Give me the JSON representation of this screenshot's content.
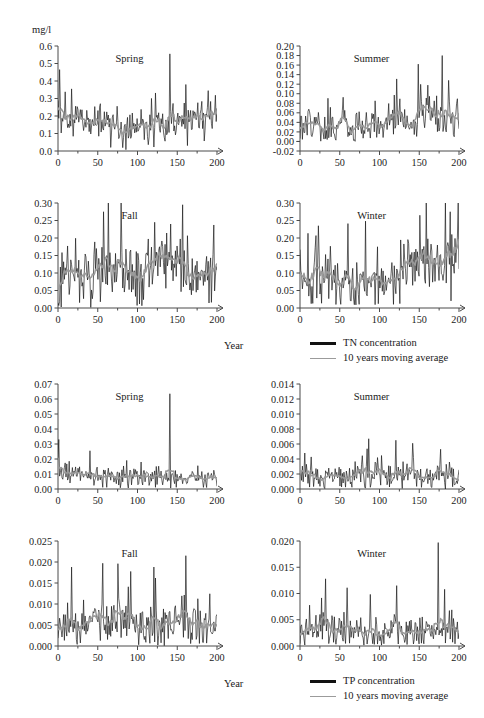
{
  "figure": {
    "unit_label": "mg/l",
    "x_axis_title": "Year"
  },
  "legends": [
    {
      "id": "tn-legend",
      "entries": [
        {
          "label": "TN concentration",
          "style": "thick",
          "color": "#111111"
        },
        {
          "label": "10 years moving average",
          "style": "thin",
          "color": "#9b9b9b"
        }
      ]
    },
    {
      "id": "tp-legend",
      "entries": [
        {
          "label": "TP concentration",
          "style": "thick",
          "color": "#111111"
        },
        {
          "label": "10 years moving average",
          "style": "thin",
          "color": "#9b9b9b"
        }
      ]
    }
  ],
  "chart_data": [
    {
      "id": "tn-spring",
      "type": "line",
      "title": "Spring",
      "variable": "TN concentration",
      "xlabel": "Year",
      "ylabel": "mg/l",
      "xlim": [
        0,
        200
      ],
      "ylim": [
        0.0,
        0.6
      ],
      "xticks": [
        0,
        50,
        100,
        150,
        200
      ],
      "yticks": [
        0.0,
        0.1,
        0.2,
        0.3,
        0.4,
        0.5,
        0.6
      ],
      "ytick_labels": [
        "0.0",
        "0.1",
        "0.2",
        "0.3",
        "0.4",
        "0.5",
        "0.6"
      ],
      "xtick_labels": [
        "0",
        "50",
        "100",
        "150",
        "200"
      ],
      "grid": false,
      "series": [
        {
          "name": "TN concentration",
          "color": "#111111",
          "noise_mean": 0.165,
          "noise_sd": 0.055,
          "clip_min": 0.0,
          "seed": 11,
          "n": 200,
          "trend": [
            {
              "x": 0,
              "y": 0.19
            },
            {
              "x": 20,
              "y": 0.185
            },
            {
              "x": 40,
              "y": 0.145
            },
            {
              "x": 70,
              "y": 0.145
            },
            {
              "x": 100,
              "y": 0.14
            },
            {
              "x": 125,
              "y": 0.145
            },
            {
              "x": 140,
              "y": 0.19
            },
            {
              "x": 165,
              "y": 0.19
            },
            {
              "x": 200,
              "y": 0.195
            }
          ],
          "spikes": [
            {
              "x": 140,
              "y": 0.555
            },
            {
              "x": 2,
              "y": 0.465
            },
            {
              "x": 17,
              "y": 0.355
            },
            {
              "x": 160,
              "y": 0.38
            },
            {
              "x": 188,
              "y": 0.345
            }
          ]
        },
        {
          "name": "10 years moving average",
          "color": "#9a9a9a",
          "window": 10,
          "derived_from": "TN concentration"
        }
      ]
    },
    {
      "id": "tn-summer",
      "type": "line",
      "title": "Summer",
      "variable": "TN concentration",
      "xlabel": "Year",
      "ylabel": "mg/l",
      "xlim": [
        0,
        200
      ],
      "ylim": [
        -0.02,
        0.2
      ],
      "xticks": [
        0,
        50,
        100,
        150,
        200
      ],
      "yticks": [
        -0.02,
        0.0,
        0.02,
        0.04,
        0.06,
        0.08,
        0.1,
        0.12,
        0.14,
        0.16,
        0.18,
        0.2
      ],
      "ytick_labels": [
        "-0.02",
        "0.00",
        "0.02",
        "0.04",
        "0.06",
        "0.08",
        "0.10",
        "0.12",
        "0.14",
        "0.16",
        "0.18",
        "0.20"
      ],
      "xtick_labels": [
        "0",
        "50",
        "100",
        "150",
        "200"
      ],
      "grid": false,
      "series": [
        {
          "name": "TN concentration",
          "color": "#111111",
          "noise_mean": 0.04,
          "noise_sd": 0.021,
          "clip_min": 0.0,
          "seed": 23,
          "n": 200,
          "trend": [
            {
              "x": 0,
              "y": 0.036
            },
            {
              "x": 30,
              "y": 0.032
            },
            {
              "x": 60,
              "y": 0.03
            },
            {
              "x": 90,
              "y": 0.036
            },
            {
              "x": 120,
              "y": 0.038
            },
            {
              "x": 150,
              "y": 0.04
            },
            {
              "x": 175,
              "y": 0.048
            },
            {
              "x": 200,
              "y": 0.044
            }
          ],
          "spikes": [
            {
              "x": 178,
              "y": 0.18
            },
            {
              "x": 148,
              "y": 0.162
            },
            {
              "x": 121,
              "y": 0.131
            },
            {
              "x": 186,
              "y": 0.128
            },
            {
              "x": 160,
              "y": 0.118
            }
          ]
        },
        {
          "name": "10 years moving average",
          "color": "#9a9a9a",
          "window": 10,
          "derived_from": "TN concentration"
        }
      ]
    },
    {
      "id": "tn-fall",
      "type": "line",
      "title": "Fall",
      "variable": "TN concentration",
      "xlabel": "Year",
      "ylabel": "mg/l",
      "xlim": [
        0,
        200
      ],
      "ylim": [
        0.0,
        0.3
      ],
      "xticks": [
        0,
        50,
        100,
        150,
        200
      ],
      "yticks": [
        0.0,
        0.05,
        0.1,
        0.15,
        0.2,
        0.25,
        0.3
      ],
      "ytick_labels": [
        "0.00",
        "0.05",
        "0.10",
        "0.15",
        "0.20",
        "0.25",
        "0.30"
      ],
      "xtick_labels": [
        "0",
        "50",
        "100",
        "150",
        "200"
      ],
      "grid": false,
      "series": [
        {
          "name": "TN concentration",
          "color": "#111111",
          "noise_mean": 0.105,
          "noise_sd": 0.04,
          "clip_min": 0.0,
          "seed": 37,
          "n": 200,
          "trend": [
            {
              "x": 0,
              "y": 0.1
            },
            {
              "x": 25,
              "y": 0.105
            },
            {
              "x": 55,
              "y": 0.115
            },
            {
              "x": 85,
              "y": 0.09
            },
            {
              "x": 110,
              "y": 0.095
            },
            {
              "x": 125,
              "y": 0.125
            },
            {
              "x": 155,
              "y": 0.13
            },
            {
              "x": 180,
              "y": 0.1
            },
            {
              "x": 200,
              "y": 0.115
            }
          ],
          "spikes": [
            {
              "x": 63,
              "y": 0.3
            },
            {
              "x": 156,
              "y": 0.295
            },
            {
              "x": 57,
              "y": 0.275
            },
            {
              "x": 121,
              "y": 0.245
            },
            {
              "x": 141,
              "y": 0.24
            }
          ]
        },
        {
          "name": "10 years moving average",
          "color": "#9a9a9a",
          "window": 10,
          "derived_from": "TN concentration"
        }
      ]
    },
    {
      "id": "tn-winter",
      "type": "line",
      "title": "Winter",
      "variable": "TN concentration",
      "xlabel": "Year",
      "ylabel": "mg/l",
      "xlim": [
        0,
        200
      ],
      "ylim": [
        0.0,
        0.3
      ],
      "xticks": [
        0,
        50,
        100,
        150,
        200
      ],
      "yticks": [
        0.0,
        0.05,
        0.1,
        0.15,
        0.2,
        0.25,
        0.3
      ],
      "ytick_labels": [
        "0.00",
        "0.05",
        "0.10",
        "0.15",
        "0.20",
        "0.25",
        "0.30"
      ],
      "xtick_labels": [
        "0",
        "50",
        "100",
        "150",
        "200"
      ],
      "grid": false,
      "series": [
        {
          "name": "TN concentration",
          "color": "#111111",
          "noise_mean": 0.095,
          "noise_sd": 0.042,
          "clip_min": 0.0,
          "seed": 53,
          "n": 200,
          "trend": [
            {
              "x": 0,
              "y": 0.095
            },
            {
              "x": 20,
              "y": 0.1
            },
            {
              "x": 45,
              "y": 0.075
            },
            {
              "x": 70,
              "y": 0.07
            },
            {
              "x": 95,
              "y": 0.08
            },
            {
              "x": 120,
              "y": 0.085
            },
            {
              "x": 145,
              "y": 0.12
            },
            {
              "x": 165,
              "y": 0.135
            },
            {
              "x": 185,
              "y": 0.13
            },
            {
              "x": 200,
              "y": 0.13
            }
          ],
          "spikes": [
            {
              "x": 158,
              "y": 0.305
            },
            {
              "x": 182,
              "y": 0.3
            },
            {
              "x": 150,
              "y": 0.265
            },
            {
              "x": 188,
              "y": 0.275
            },
            {
              "x": 23,
              "y": 0.235
            }
          ]
        },
        {
          "name": "10 years moving average",
          "color": "#9a9a9a",
          "window": 10,
          "derived_from": "TN concentration"
        }
      ]
    },
    {
      "id": "tp-spring",
      "type": "line",
      "title": "Spring",
      "variable": "TP concentration",
      "xlabel": "Year",
      "ylabel": "mg/l",
      "xlim": [
        0,
        200
      ],
      "ylim": [
        0.0,
        0.07
      ],
      "xticks": [
        0,
        50,
        100,
        150,
        200
      ],
      "yticks": [
        0.0,
        0.01,
        0.02,
        0.03,
        0.04,
        0.05,
        0.06,
        0.07
      ],
      "ytick_labels": [
        "0.00",
        "0.01",
        "0.02",
        "0.03",
        "0.04",
        "0.05",
        "0.06",
        "0.07"
      ],
      "xtick_labels": [
        "0",
        "50",
        "100",
        "150",
        "200"
      ],
      "grid": false,
      "series": [
        {
          "name": "TP concentration",
          "color": "#111111",
          "noise_mean": 0.008,
          "noise_sd": 0.0033,
          "clip_min": 0.0,
          "seed": 67,
          "n": 200,
          "trend": [
            {
              "x": 0,
              "y": 0.0105
            },
            {
              "x": 15,
              "y": 0.0095
            },
            {
              "x": 45,
              "y": 0.0085
            },
            {
              "x": 80,
              "y": 0.008
            },
            {
              "x": 120,
              "y": 0.0078
            },
            {
              "x": 150,
              "y": 0.0075
            },
            {
              "x": 200,
              "y": 0.0072
            }
          ],
          "spikes": [
            {
              "x": 140,
              "y": 0.0635
            },
            {
              "x": 1,
              "y": 0.033
            },
            {
              "x": 40,
              "y": 0.0255
            },
            {
              "x": 14,
              "y": 0.0185
            },
            {
              "x": 104,
              "y": 0.018
            }
          ]
        },
        {
          "name": "10 years moving average",
          "color": "#9a9a9a",
          "window": 10,
          "derived_from": "TP concentration"
        }
      ]
    },
    {
      "id": "tp-summer",
      "type": "line",
      "title": "Summer",
      "variable": "TP concentration",
      "xlabel": "Year",
      "ylabel": "mg/l",
      "xlim": [
        0,
        200
      ],
      "ylim": [
        0.0,
        0.014
      ],
      "xticks": [
        0,
        50,
        100,
        150,
        200
      ],
      "yticks": [
        0.0,
        0.002,
        0.004,
        0.006,
        0.008,
        0.01,
        0.012,
        0.014
      ],
      "ytick_labels": [
        "0.000",
        "0.002",
        "0.004",
        "0.006",
        "0.008",
        "0.010",
        "0.012",
        "0.014"
      ],
      "xtick_labels": [
        "0",
        "50",
        "100",
        "150",
        "200"
      ],
      "grid": false,
      "series": [
        {
          "name": "TP concentration",
          "color": "#111111",
          "noise_mean": 0.0019,
          "noise_sd": 0.00095,
          "clip_min": 0.0,
          "seed": 79,
          "n": 200,
          "trend": [
            {
              "x": 0,
              "y": 0.0021
            },
            {
              "x": 30,
              "y": 0.0019
            },
            {
              "x": 60,
              "y": 0.0016
            },
            {
              "x": 90,
              "y": 0.0018
            },
            {
              "x": 120,
              "y": 0.0018
            },
            {
              "x": 150,
              "y": 0.0017
            },
            {
              "x": 180,
              "y": 0.0019
            },
            {
              "x": 200,
              "y": 0.0017
            }
          ],
          "spikes": [
            {
              "x": 86,
              "y": 0.0067
            },
            {
              "x": 120,
              "y": 0.0065
            },
            {
              "x": 141,
              "y": 0.0061
            },
            {
              "x": 176,
              "y": 0.0053
            },
            {
              "x": 6,
              "y": 0.0048
            }
          ]
        },
        {
          "name": "10 years moving average",
          "color": "#9a9a9a",
          "window": 10,
          "derived_from": "TP concentration"
        }
      ]
    },
    {
      "id": "tp-fall",
      "type": "line",
      "title": "Fall",
      "variable": "TP concentration",
      "xlabel": "Year",
      "ylabel": "mg/l",
      "xlim": [
        0,
        200
      ],
      "ylim": [
        0.0,
        0.025
      ],
      "xticks": [
        0,
        50,
        100,
        150,
        200
      ],
      "yticks": [
        0.0,
        0.005,
        0.01,
        0.015,
        0.02,
        0.025
      ],
      "ytick_labels": [
        "0.000",
        "0.005",
        "0.010",
        "0.015",
        "0.020",
        "0.025"
      ],
      "xtick_labels": [
        "0",
        "50",
        "100",
        "150",
        "200"
      ],
      "grid": false,
      "series": [
        {
          "name": "TP concentration",
          "color": "#111111",
          "noise_mean": 0.006,
          "noise_sd": 0.0028,
          "clip_min": 0.0,
          "seed": 91,
          "n": 200,
          "trend": [
            {
              "x": 0,
              "y": 0.0065
            },
            {
              "x": 25,
              "y": 0.0058
            },
            {
              "x": 55,
              "y": 0.0062
            },
            {
              "x": 80,
              "y": 0.0058
            },
            {
              "x": 105,
              "y": 0.0048
            },
            {
              "x": 130,
              "y": 0.0058
            },
            {
              "x": 160,
              "y": 0.0058
            },
            {
              "x": 200,
              "y": 0.0055
            }
          ],
          "spikes": [
            {
              "x": 160,
              "y": 0.0215
            },
            {
              "x": 56,
              "y": 0.0197
            },
            {
              "x": 75,
              "y": 0.0196
            },
            {
              "x": 17,
              "y": 0.0188
            },
            {
              "x": 120,
              "y": 0.0188
            }
          ]
        },
        {
          "name": "10 years moving average",
          "color": "#9a9a9a",
          "window": 10,
          "derived_from": "TP concentration"
        }
      ]
    },
    {
      "id": "tp-winter",
      "type": "line",
      "title": "Winter",
      "variable": "TP concentration",
      "xlabel": "Year",
      "ylabel": "mg/l",
      "xlim": [
        0,
        200
      ],
      "ylim": [
        0.0,
        0.02
      ],
      "xticks": [
        0,
        50,
        100,
        150,
        200
      ],
      "yticks": [
        0.0,
        0.005,
        0.01,
        0.015,
        0.02
      ],
      "ytick_labels": [
        "0.000",
        "0.005",
        "0.010",
        "0.015",
        "0.020"
      ],
      "xtick_labels": [
        "0",
        "50",
        "100",
        "150",
        "200"
      ],
      "grid": false,
      "series": [
        {
          "name": "TP concentration",
          "color": "#111111",
          "noise_mean": 0.003,
          "noise_sd": 0.0016,
          "clip_min": 0.0,
          "seed": 103,
          "n": 200,
          "trend": [
            {
              "x": 0,
              "y": 0.0032
            },
            {
              "x": 25,
              "y": 0.0036
            },
            {
              "x": 50,
              "y": 0.0032
            },
            {
              "x": 75,
              "y": 0.0024
            },
            {
              "x": 100,
              "y": 0.0026
            },
            {
              "x": 125,
              "y": 0.003
            },
            {
              "x": 150,
              "y": 0.0026
            },
            {
              "x": 175,
              "y": 0.0032
            },
            {
              "x": 200,
              "y": 0.003
            }
          ],
          "spikes": [
            {
              "x": 173,
              "y": 0.0197
            },
            {
              "x": 32,
              "y": 0.0128
            },
            {
              "x": 121,
              "y": 0.0115
            },
            {
              "x": 59,
              "y": 0.0111
            },
            {
              "x": 181,
              "y": 0.0108
            }
          ]
        },
        {
          "name": "10 years moving average",
          "color": "#9a9a9a",
          "window": 10,
          "derived_from": "TP concentration"
        }
      ]
    }
  ]
}
